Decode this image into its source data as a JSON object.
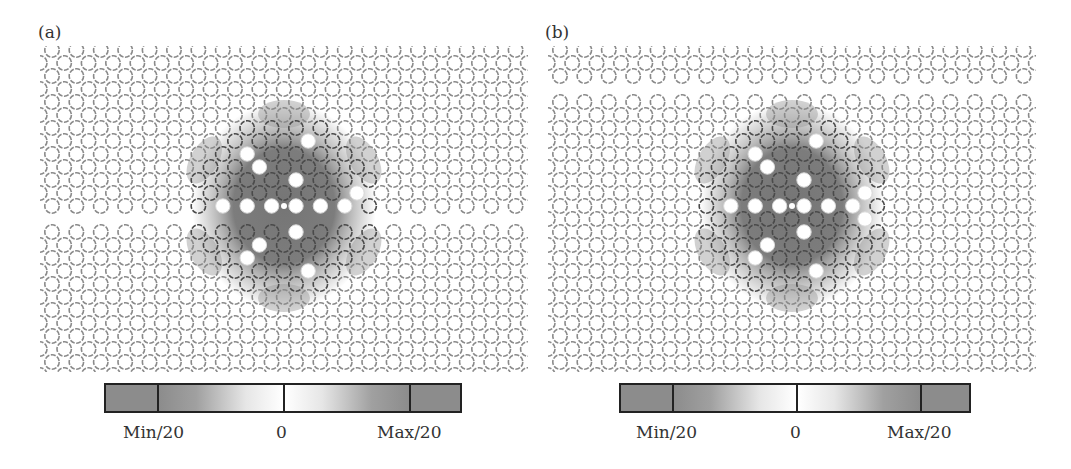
{
  "figure": {
    "panels": [
      {
        "id": "a",
        "label": "(a)",
        "description": "Photonic crystal triangular lattice of air holes with a horizontal line-defect waveguide through the center row; field distribution of a hexapole-like cavity mode centered in the lattice",
        "defect_row_position": "center",
        "colorbar": {
          "min_label": "Min/20",
          "zero_label": "0",
          "max_label": "Max/20"
        }
      },
      {
        "id": "b",
        "label": "(b)",
        "description": "Photonic crystal triangular lattice of air holes with a horizontal line-defect waveguide near the top; field distribution of the cavity mode centered in the lattice",
        "defect_row_position": "top",
        "colorbar": {
          "min_label": "Min/20",
          "zero_label": "0",
          "max_label": "Max/20"
        }
      }
    ],
    "colors": {
      "hole_ring": "#8a8a8a",
      "field_dark": "#6e6e6e",
      "field_mid": "#9a9a9a",
      "colorbar_saturated": "#8c8c8c",
      "colorbar_zero": "#ffffff",
      "border": "#222222"
    }
  }
}
